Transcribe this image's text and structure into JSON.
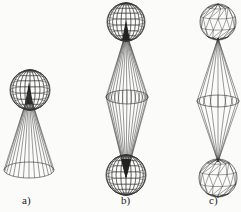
{
  "figure": {
    "panels": [
      {
        "id": "a",
        "label": "a)",
        "description": "sphere on a cone (wireframe)",
        "sphere": {
          "cx": 30,
          "cy": 90,
          "r": 20,
          "mesh": "lat-long"
        },
        "cone": {
          "apex": [
            29,
            92
          ],
          "base_cx": 29,
          "base_cy": 170,
          "base_rx": 25,
          "base_ry": 8
        }
      },
      {
        "id": "b",
        "label": "b)",
        "description": "two spheres joined by double cone (wireframe)",
        "top_sphere": {
          "cx": 126,
          "cy": 22,
          "r": 19,
          "mesh": "lat-long"
        },
        "bottom_sphere": {
          "cx": 126,
          "cy": 175,
          "r": 20,
          "mesh": "lat-long"
        },
        "middle": {
          "cx": 127,
          "cy": 97,
          "rx": 21,
          "ry": 7
        }
      },
      {
        "id": "c",
        "label": "c)",
        "description": "two triangulated spheres joined by double cone (coarse wireframe)",
        "top_sphere": {
          "cx": 218,
          "cy": 22,
          "r": 18,
          "mesh": "triangulated"
        },
        "bottom_sphere": {
          "cx": 218,
          "cy": 178,
          "r": 19,
          "mesh": "triangulated"
        },
        "middle": {
          "cx": 218,
          "cy": 101,
          "rx": 21,
          "ry": 6
        }
      }
    ],
    "colors": {
      "line": "#333333",
      "background": "#fbfbfa"
    }
  }
}
